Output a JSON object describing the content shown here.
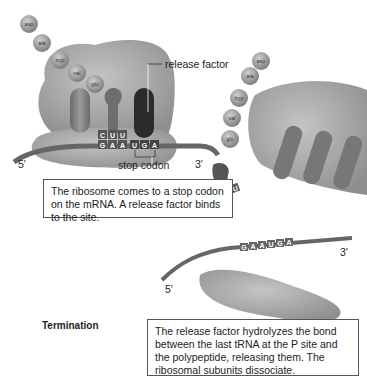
{
  "figure": {
    "section_title": "Termination",
    "labels": {
      "release_factor": "release factor",
      "stop_codon": "stop codon",
      "five_prime": "5′",
      "three_prime": "3′"
    },
    "captions": {
      "step1": "The ribosome comes to a stop codon on the mRNA. A release factor binds to the site.",
      "step2": "The release factor hydrolyzes the bond between the last tRNA at the P site and the polypeptide, releasing them. The ribosomal subunits dissociate."
    },
    "polypeptide": [
      "asp",
      "ala",
      "tryp",
      "val",
      "glu"
    ],
    "anticodon": [
      "C",
      "U",
      "U"
    ],
    "mrna_codons": [
      "G",
      "A",
      "A",
      "U",
      "G",
      "A"
    ],
    "colors": {
      "ribosome": "#a3a3a3",
      "trna": "#7a7a7a",
      "release_factor": "#2a2a2a",
      "amino_acid": "#9a9a9a",
      "caption_border": "#555555"
    }
  }
}
